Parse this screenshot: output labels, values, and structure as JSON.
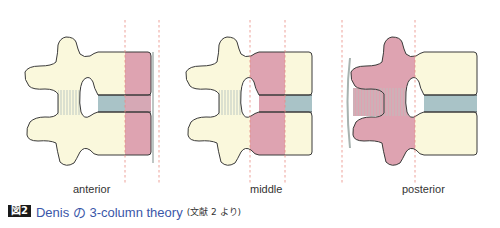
{
  "figure": {
    "badge": "図2",
    "title": "Denis の 3-column theory",
    "reference": "(文献 2 より)"
  },
  "panels": [
    {
      "label": "anterior",
      "highlighted_column": "anterior",
      "highlight_color": "#dea3b1"
    },
    {
      "label": "middle",
      "highlighted_column": "middle",
      "highlight_color": "#dea3b1"
    },
    {
      "label": "posterior",
      "highlighted_column": "posterior",
      "highlight_color": "#dea3b1"
    }
  ],
  "colors": {
    "bone": "#faf8dc",
    "highlight": "#dea3b1",
    "disc": "#a9c3c7",
    "outline": "#3a3a3a",
    "divider": "#e88a80",
    "ligament": "#b8c6c2",
    "caption_title": "#3a56a8"
  }
}
